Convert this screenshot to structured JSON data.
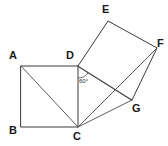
{
  "figure": {
    "background_color": "#ffffff",
    "stroke_color": "#3a3a3a",
    "label_color": "#1a1a1a",
    "points": {
      "A": {
        "label": "A",
        "x": 21,
        "y": 66,
        "label_x": 9,
        "label_y": 50
      },
      "B": {
        "label": "B",
        "x": 21,
        "y": 127,
        "label_x": 9,
        "label_y": 125
      },
      "C": {
        "label": "C",
        "x": 78,
        "y": 127,
        "label_x": 73,
        "label_y": 131
      },
      "D": {
        "label": "D",
        "x": 78,
        "y": 66,
        "label_x": 66,
        "label_y": 50
      },
      "E": {
        "label": "E",
        "x": 108,
        "y": 21,
        "label_x": 102,
        "label_y": 4
      },
      "F": {
        "label": "F",
        "x": 157,
        "y": 48,
        "label_x": 157,
        "label_y": 38
      },
      "G": {
        "label": "G",
        "x": 132,
        "y": 100,
        "label_x": 132,
        "label_y": 103
      }
    },
    "square_abcd": {
      "name": "square-abcd",
      "path": "M 21 66 L 78 66 L 78 127 L 21 127 Z",
      "vertices": [
        "A",
        "D",
        "C",
        "B"
      ]
    },
    "square_defg": {
      "name": "square-defg",
      "path": "M 78 66 L 108 21 L 157 48 L 132 100 Z",
      "vertices": [
        "D",
        "E",
        "F",
        "G"
      ]
    },
    "diagonals": [
      {
        "name": "diagonal-ac",
        "from": "A",
        "to": "C",
        "path": "M 21 66 L 78 127"
      },
      {
        "name": "segment-dg",
        "from": "D",
        "to": "G",
        "path": "M 78 66 L 132 100"
      },
      {
        "name": "segment-cf",
        "from": "C",
        "to": "F",
        "path": "M 78 127 L 157 48"
      },
      {
        "name": "segment-cg",
        "from": "C",
        "to": "G",
        "path": "M 78 127 L 132 100"
      }
    ],
    "angle_marker": {
      "name": "angle-at-d",
      "value": "60",
      "label": "60°",
      "at_vertex": "D",
      "arc_path": "M 78 78 A 12 12 0 0 0 88 73",
      "label_x": 79,
      "label_y": 78
    }
  }
}
